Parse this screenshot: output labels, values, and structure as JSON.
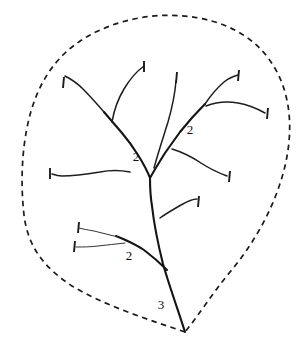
{
  "figure": {
    "background_color": "#ffffff",
    "ink_color": "#1b1b1b",
    "width": 303,
    "height": 341
  },
  "leaf_outline": {
    "name": "leaf-margin",
    "style": "dashed",
    "stroke_color": "#1b1b1b",
    "apex_point": [
      185,
      332
    ],
    "path": "M 185 332 C 150 320 105 306 72 286 C 45 268 28 248 24 215 C 20 180 22 140 32 108 C 44 70 66 46 98 31 C 130 16 166 12 199 18 C 236 25 264 44 279 76 C 292 104 292 136 285 166 C 276 204 256 241 230 272 C 212 294 198 316 185 332 Z"
  },
  "labels": [
    {
      "id": "order-2-left",
      "text": "2",
      "x": 136,
      "y": 158
    },
    {
      "id": "order-2-right",
      "text": "2",
      "x": 190,
      "y": 131
    },
    {
      "id": "order-2-lower-left",
      "text": "2",
      "x": 129,
      "y": 257
    },
    {
      "id": "order-3-midrib",
      "text": "3",
      "x": 161,
      "y": 306
    }
  ],
  "veins": {
    "midrib": {
      "id": "midrib-order-3",
      "order": 3,
      "class": "vein-primary",
      "path": "M 185 332 C 178 310 170 288 163 264 C 158 244 154 224 152 206 C 150 194 150 186 150 178"
    },
    "secondary": [
      {
        "id": "secondary-upper-left",
        "order": 2,
        "class": "vein-primary",
        "path": "M 150 178 C 147 170 143 163 138 155 C 133 147 128 140 122 133 C 116 126 110 119 104 112"
      },
      {
        "id": "secondary-upper-right",
        "order": 2,
        "class": "vein-primary",
        "path": "M 150 178 C 155 169 160 161 165 153 C 170 146 175 139 180 132 C 188 122 196 113 205 104"
      },
      {
        "id": "secondary-lower-left",
        "order": 2,
        "class": "vein-primary",
        "path": "M 167 270 C 160 263 152 256 144 250 C 135 244 126 240 116 236"
      }
    ],
    "tertiary": [
      {
        "id": "vein-left-upper-long",
        "class": "vein-secondary",
        "path": "M 104 112 C 97 104 90 96 83 89 C 77 83 71 79 65 76"
      },
      {
        "id": "vein-left-upper-branch",
        "class": "vein-secondary",
        "path": "M 112 122 C 114 110 118 99 124 89 C 130 79 137 71 144 66"
      },
      {
        "id": "vein-left-mid",
        "class": "vein-secondary",
        "path": "M 130 172 C 120 170 110 170 100 172 C 88 174 75 176 62 176 C 58 176 55 175 52 174"
      },
      {
        "id": "vein-center-long",
        "class": "vein-secondary",
        "path": "M 154 168 C 158 153 163 138 168 122 C 172 108 175 94 176 81"
      },
      {
        "id": "vein-right-upper",
        "class": "vein-secondary",
        "path": "M 205 104 C 211 95 217 88 224 82 C 229 78 234 76 238 75"
      },
      {
        "id": "vein-right-horizontal",
        "class": "vein-secondary",
        "path": "M 206 106 C 216 102 227 101 238 103 C 249 105 258 109 265 113"
      },
      {
        "id": "vein-right-mid",
        "class": "vein-secondary",
        "path": "M 172 149 C 182 152 192 157 201 163 C 210 169 219 173 227 176"
      },
      {
        "id": "vein-right-lower",
        "class": "vein-secondary",
        "path": "M 160 218 C 167 213 174 209 181 205 C 188 201 193 199 197 199"
      },
      {
        "id": "vein-lower-left-a",
        "class": "vein-tertiary",
        "path": "M 118 237 C 110 235 102 233 94 231 C 88 230 83 229 79 228"
      },
      {
        "id": "vein-lower-left-b",
        "class": "vein-tertiary",
        "path": "M 125 243 C 116 244 107 245 98 246 C 90 247 83 247 76 247"
      }
    ]
  },
  "tick_marks": [
    {
      "id": "tick-left-upper",
      "x1": 64,
      "y1": 77,
      "x2": 63,
      "y2": 88
    },
    {
      "id": "tick-top-center",
      "x1": 144,
      "y1": 61,
      "x2": 144,
      "y2": 72
    },
    {
      "id": "tick-top-mid-right",
      "x1": 177,
      "y1": 72,
      "x2": 176,
      "y2": 83
    },
    {
      "id": "tick-top-right",
      "x1": 239,
      "y1": 70,
      "x2": 238,
      "y2": 81
    },
    {
      "id": "tick-far-right",
      "x1": 268,
      "y1": 108,
      "x2": 267,
      "y2": 119
    },
    {
      "id": "tick-left-mid",
      "x1": 50,
      "y1": 168,
      "x2": 50,
      "y2": 179
    },
    {
      "id": "tick-right-mid",
      "x1": 230,
      "y1": 171,
      "x2": 229,
      "y2": 182
    },
    {
      "id": "tick-right-lower",
      "x1": 199,
      "y1": 196,
      "x2": 198,
      "y2": 207
    },
    {
      "id": "tick-lower-left-upper",
      "x1": 79,
      "y1": 222,
      "x2": 78,
      "y2": 233
    },
    {
      "id": "tick-lower-left-lower",
      "x1": 75,
      "y1": 241,
      "x2": 74,
      "y2": 252
    }
  ],
  "chart_data": {
    "type": "diagram",
    "order_labels": [
      "2",
      "2",
      "2",
      "3"
    ],
    "order_counts": {
      "order_3": 1,
      "order_2": 3
    },
    "tick_mark_count": 10,
    "vein_count": {
      "primary": 1,
      "secondary": 3,
      "tertiary": 10
    }
  }
}
